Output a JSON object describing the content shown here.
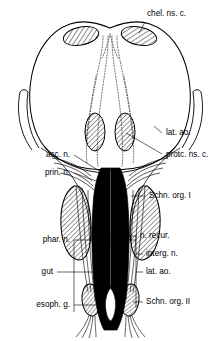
{
  "figure": {
    "background_color": "#ffffff",
    "ink_color": "#000000",
    "gut_fill_color": "#000000",
    "hatch_color": "#000000",
    "width": 221,
    "height": 341
  },
  "labels": {
    "chel_ns_c": "chel. ns. c.",
    "lat_ao_upper": "lat. ao.",
    "protc_ns_c": "protc. ns. c.",
    "acc_n": "acc. n.",
    "prin_n": "prin. n.",
    "schn_org_i": "Schn. org. I",
    "phar_n": "phar. n.",
    "n_recur": "n. recur.",
    "interg_n": "interg. n.",
    "lat_ao_lower": "lat. ao.",
    "gut": "gut",
    "esoph_g": "esoph. g.",
    "schn_org_ii": "Schn. org. II"
  },
  "structures": {
    "brain_outline": "brain-outline",
    "cheliceral_ganglion_left": "cheliceral-ganglion-left",
    "cheliceral_ganglion_right": "cheliceral-ganglion-right",
    "protocerebral_ganglion_left": "protocerebral-ganglion-left",
    "protocerebral_ganglion_right": "protocerebral-ganglion-right",
    "schneider_organ_i_left": "schneider-organ-i-left",
    "schneider_organ_i_right": "schneider-organ-i-right",
    "schneider_organ_ii_left": "schneider-organ-ii-left",
    "schneider_organ_ii_right": "schneider-organ-ii-right",
    "gut_tract": "gut-tract",
    "lateral_aorta_left": "lateral-aorta-left",
    "lateral_aorta_right": "lateral-aorta-right",
    "nerve_tracts_stippled": "stippled-nerve-tracts",
    "pharyngeal_nerves": "pharyngeal-nerves",
    "recurrent_nerve": "recurrent-nerve",
    "terminal_fibers": "terminal-nerve-fibers"
  }
}
